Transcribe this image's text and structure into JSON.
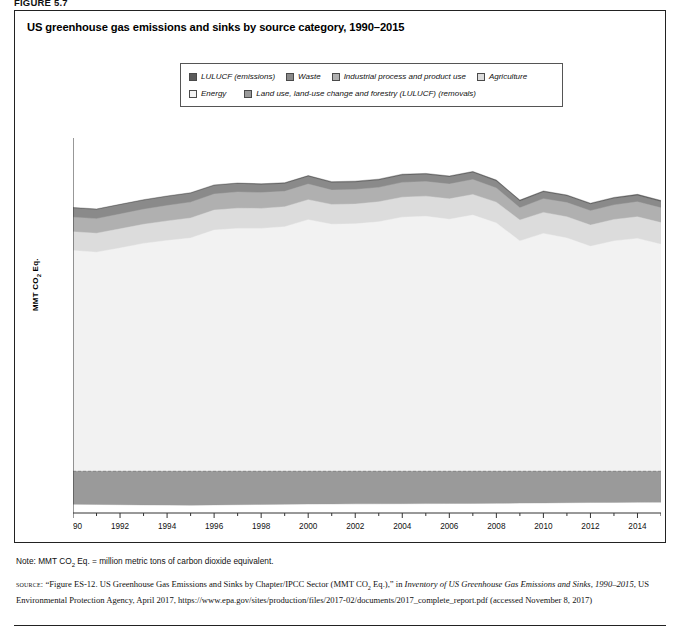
{
  "figure_label": "FIGURE 5.7",
  "chart_title": "US greenhouse gas emissions and sinks by source category, 1990–2015",
  "legend": {
    "items": [
      {
        "label": "LULUCF (emissions)",
        "color": "#5b5b5b",
        "row": 1
      },
      {
        "label": "Waste",
        "color": "#8a8a8a",
        "row": 1
      },
      {
        "label": "Industrial process and product use",
        "color": "#b0b0b0",
        "row": 1
      },
      {
        "label": "Agriculture",
        "color": "#dcdcdc",
        "row": 1
      },
      {
        "label": "Energy",
        "color": "#f2f2f2",
        "row": 2
      },
      {
        "label": "Land use, land-use change and forestry (LULUCF) (removals)",
        "color": "#9a9a9a",
        "row": 2
      }
    ]
  },
  "note": "Note: MMT CO2 Eq. = million metric tons of carbon dioxide equivalent.",
  "note_parts": {
    "prefix": "Note: MMT CO",
    "sub": "2",
    "suffix": " Eq. = million metric tons of carbon dioxide equivalent."
  },
  "source": {
    "label": "source:",
    "text_1": "“Figure ES-12. US Greenhouse Gas Emissions and Sinks by Chapter/IPCC Sector (MMT CO",
    "sub_1": "2",
    "text_2": " Eq.),” in ",
    "italic_1": "Inventory of US Greenhouse Gas Emissions and Sinks, 1990–2015",
    "text_3": ", US Environmental Protection Agency, April 2017, https://www.epa.gov/sites/production/files/2017-02/documents/2017_complete_report.pdf (accessed November 8, 2017)"
  },
  "chart_data": {
    "type": "area",
    "title": "US greenhouse gas emissions and sinks by source category, 1990–2015",
    "xlabel": "",
    "ylabel": "MMT CO2 Eq.",
    "ylabel_parts": {
      "prefix": "MMT CO",
      "sub": "2",
      "suffix": " Eq."
    },
    "ylim": [
      -1000,
      8000
    ],
    "ytick_values": [
      -1000,
      0,
      1000,
      2000,
      3000,
      4000,
      5000,
      6000,
      7000,
      8000
    ],
    "ytick_labels": [
      "–1,000",
      "0",
      "1,000",
      "2,000",
      "3,000",
      "4,000",
      "5,000",
      "6,000",
      "7,000",
      "8,000"
    ],
    "xlim": [
      1990,
      2015
    ],
    "xtick_values": [
      1990,
      1992,
      1994,
      1996,
      1998,
      2000,
      2002,
      2004,
      2006,
      2008,
      2010,
      2012,
      2014
    ],
    "xtick_labels": [
      "1990",
      "1992",
      "1994",
      "1996",
      "1998",
      "2000",
      "2002",
      "2004",
      "2006",
      "2008",
      "2010",
      "2012",
      "2014"
    ],
    "grid": false,
    "legend_position": "top",
    "stacked": true,
    "x": [
      1990,
      1991,
      1992,
      1993,
      1994,
      1995,
      1996,
      1997,
      1998,
      1999,
      2000,
      2001,
      2002,
      2003,
      2004,
      2005,
      2006,
      2007,
      2008,
      2009,
      2010,
      2011,
      2012,
      2013,
      2014,
      2015
    ],
    "series": [
      {
        "name": "Energy",
        "color": "#f2f2f2",
        "values": [
          5300,
          5260,
          5360,
          5470,
          5540,
          5600,
          5790,
          5830,
          5830,
          5870,
          6040,
          5930,
          5940,
          5990,
          6100,
          6120,
          6050,
          6150,
          5960,
          5530,
          5710,
          5600,
          5400,
          5530,
          5590,
          5450
        ]
      },
      {
        "name": "Agriculture",
        "color": "#dcdcdc",
        "values": [
          450,
          455,
          460,
          460,
          470,
          480,
          480,
          485,
          480,
          480,
          480,
          475,
          475,
          480,
          480,
          485,
          490,
          495,
          500,
          500,
          505,
          510,
          510,
          515,
          520,
          520
        ]
      },
      {
        "name": "Industrial process and product use",
        "color": "#b0b0b0",
        "values": [
          350,
          350,
          355,
          360,
          370,
          380,
          385,
          390,
          380,
          370,
          375,
          345,
          350,
          345,
          355,
          350,
          355,
          360,
          340,
          295,
          330,
          340,
          345,
          350,
          360,
          355
        ]
      },
      {
        "name": "Waste",
        "color": "#8a8a8a",
        "values": [
          215,
          215,
          215,
          212,
          210,
          208,
          200,
          195,
          190,
          185,
          180,
          178,
          176,
          174,
          172,
          170,
          168,
          166,
          164,
          160,
          158,
          156,
          154,
          152,
          150,
          148
        ]
      },
      {
        "name": "LULUCF (emissions)",
        "color": "#5b5b5b",
        "values": [
          18,
          18,
          18,
          18,
          19,
          19,
          20,
          20,
          21,
          22,
          23,
          24,
          24,
          24,
          25,
          25,
          26,
          26,
          26,
          25,
          26,
          26,
          27,
          27,
          28,
          28
        ]
      },
      {
        "name": "Land use, land-use change and forestry (LULUCF) (removals)",
        "color": "#9a9a9a",
        "negative": true,
        "values": [
          -790,
          -795,
          -800,
          -805,
          -810,
          -812,
          -805,
          -800,
          -795,
          -790,
          -785,
          -782,
          -780,
          -778,
          -776,
          -774,
          -772,
          -770,
          -768,
          -762,
          -758,
          -752,
          -748,
          -745,
          -742,
          -740
        ]
      }
    ]
  }
}
